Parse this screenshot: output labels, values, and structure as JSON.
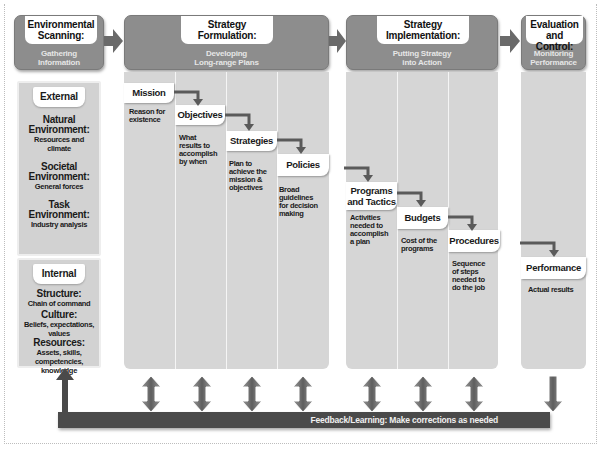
{
  "stages": [
    {
      "id": "scanning",
      "title_line1": "Environmental",
      "title_line2": "Scanning:",
      "sub_line1": "Gathering",
      "sub_line2": "Information"
    },
    {
      "id": "formulation",
      "title_line1": "Strategy",
      "title_line2": "Formulation:",
      "sub_line1": "Developing",
      "sub_line2": "Long-range Plans"
    },
    {
      "id": "implementation",
      "title_line1": "Strategy",
      "title_line2": "Implementation:",
      "sub_line1": "Putting Strategy",
      "sub_line2": "into Action"
    },
    {
      "id": "evaluation",
      "title_line1": "Evaluation",
      "title_line2": "and Control:",
      "sub_line1": "Monitoring",
      "sub_line2": "Performance"
    }
  ],
  "external": {
    "heading": "External",
    "items": [
      {
        "title_line1": "Natural",
        "title_line2": "Environment:",
        "desc_line1": "Resources and",
        "desc_line2": "climate"
      },
      {
        "title_line1": "Societal",
        "title_line2": "Environment:",
        "desc_line1": "General forces",
        "desc_line2": ""
      },
      {
        "title_line1": "Task",
        "title_line2": "Environment:",
        "desc_line1": "Industry analysis",
        "desc_line2": ""
      }
    ]
  },
  "internal": {
    "heading": "Internal",
    "items": [
      {
        "title": "Structure:",
        "desc_lines": [
          "Chain of command"
        ]
      },
      {
        "title": "Culture:",
        "desc_lines": [
          "Beliefs, expectations,",
          "values"
        ]
      },
      {
        "title": "Resources:",
        "desc_lines": [
          "Assets, skills,",
          "competencies,",
          "knowledge"
        ]
      }
    ]
  },
  "steps": [
    {
      "id": "mission",
      "label": "Mission",
      "desc": [
        "Reason for",
        "existence"
      ]
    },
    {
      "id": "objectives",
      "label": "Objectives",
      "desc": [
        "What",
        "results to",
        "accomplish",
        "by when"
      ]
    },
    {
      "id": "strategies",
      "label": "Strategies",
      "desc": [
        "Plan to",
        "achieve the",
        "mission &",
        "objectives"
      ]
    },
    {
      "id": "policies",
      "label": "Policies",
      "desc": [
        "Broad",
        "guidelines",
        "for decision",
        "making"
      ]
    },
    {
      "id": "programs",
      "label_line1": "Programs",
      "label_line2": "and Tactics",
      "desc": [
        "Activities",
        "needed to",
        "accomplish",
        "a plan"
      ]
    },
    {
      "id": "budgets",
      "label": "Budgets",
      "desc": [
        "Cost of the",
        "programs"
      ]
    },
    {
      "id": "procedures",
      "label": "Procedures",
      "desc": [
        "Sequence",
        "of steps",
        "needed to",
        "do the job"
      ]
    },
    {
      "id": "performance",
      "label": "Performance",
      "desc": [
        "Actual results"
      ]
    }
  ],
  "feedback": {
    "label": "Feedback/Learning: Make corrections as needed"
  },
  "colors": {
    "stage_fill": "#8d8d8d",
    "column_fill": "#d6d6d6",
    "connector": "#5a5a5a",
    "feedback_bar": "#4a4a4a"
  }
}
